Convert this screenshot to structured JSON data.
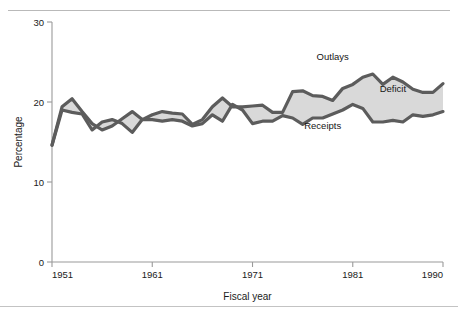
{
  "figure": {
    "top_rule": true,
    "bottom_rule": true,
    "clipped_title": "",
    "background": "#ffffff"
  },
  "colors": {
    "line": "#5c5c5c",
    "fill": "#d9d9d9",
    "axis": "#9a9a9a",
    "text": "#1a1a1a"
  },
  "chart_data": {
    "type": "area",
    "title": "",
    "xlabel": "Fiscal year",
    "ylabel": "Percentage",
    "xlim": [
      1951,
      1990
    ],
    "ylim": [
      0,
      30
    ],
    "xticks": [
      1951,
      1961,
      1971,
      1981,
      1990
    ],
    "xtick_labels": [
      "1951",
      "1961",
      "1971",
      "1981",
      "1990"
    ],
    "yticks": [
      0,
      10,
      20,
      30
    ],
    "ytick_labels": [
      "0",
      "10",
      "20",
      "30"
    ],
    "grid": false,
    "legend_position": "inline-annotations",
    "annotations": [
      {
        "text": "Outlays",
        "x": 1979,
        "y": 25.2
      },
      {
        "text": "Deficit",
        "x": 1985,
        "y": 21.3
      },
      {
        "text": "Receipts",
        "x": 1978,
        "y": 16.6
      }
    ],
    "x": [
      1951,
      1952,
      1953,
      1954,
      1955,
      1956,
      1957,
      1958,
      1959,
      1960,
      1961,
      1962,
      1963,
      1964,
      1965,
      1966,
      1967,
      1968,
      1969,
      1970,
      1971,
      1972,
      1973,
      1974,
      1975,
      1976,
      1977,
      1978,
      1979,
      1980,
      1981,
      1982,
      1983,
      1984,
      1985,
      1986,
      1987,
      1988,
      1989,
      1990
    ],
    "series": [
      {
        "name": "Outlays",
        "values": [
          14.6,
          19.4,
          20.4,
          18.8,
          17.3,
          16.5,
          17.0,
          17.9,
          18.8,
          17.8,
          18.4,
          18.8,
          18.6,
          18.5,
          17.2,
          17.8,
          19.4,
          20.5,
          19.4,
          19.4,
          19.5,
          19.6,
          18.7,
          18.7,
          21.3,
          21.4,
          20.8,
          20.7,
          20.2,
          21.7,
          22.2,
          23.1,
          23.5,
          22.2,
          23.1,
          22.5,
          21.6,
          21.2,
          21.2,
          22.3
        ]
      },
      {
        "name": "Receipts",
        "values": [
          14.6,
          19.0,
          18.7,
          18.5,
          16.5,
          17.5,
          17.8,
          17.3,
          16.2,
          17.8,
          17.8,
          17.6,
          17.8,
          17.6,
          17.0,
          17.3,
          18.4,
          17.6,
          19.7,
          19.0,
          17.3,
          17.6,
          17.6,
          18.3,
          18.0,
          17.2,
          18.0,
          18.0,
          18.5,
          19.0,
          19.7,
          19.2,
          17.5,
          17.5,
          17.7,
          17.5,
          18.4,
          18.2,
          18.4,
          18.8
        ]
      }
    ]
  }
}
